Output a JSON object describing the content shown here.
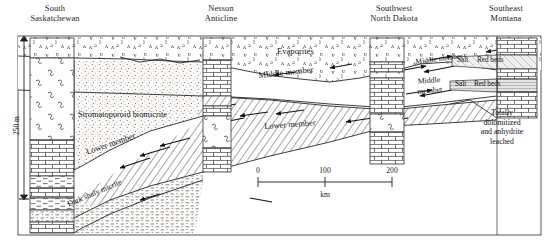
{
  "figure": {
    "type": "geologic-cross-section",
    "orientation": "west-to-east",
    "frame": {
      "x": 18,
      "y": 36,
      "width": 523,
      "height": 199
    }
  },
  "locations": [
    {
      "id": "south-saskatchewan",
      "label": "South\nSaskatchewan",
      "x": 38,
      "y": 4
    },
    {
      "id": "nesson-anticline",
      "label": "Nesson\nAnticline",
      "x": 220,
      "y": 4
    },
    {
      "id": "southwest-north-dakota",
      "label": "Southwest\nNorth Dakota",
      "x": 394,
      "y": 4
    },
    {
      "id": "southeast-montana",
      "label": "Southeast\nMontana",
      "x": 512,
      "y": 4
    }
  ],
  "units": [
    {
      "id": "evaporites",
      "label": "Evaporites",
      "x": 310,
      "y": 52,
      "size": 8.6,
      "italic": false
    },
    {
      "id": "middle-member-main",
      "label": "Middle member",
      "x": 300,
      "y": 78,
      "size": 8.6,
      "rotate": -6
    },
    {
      "id": "middle-member-right-upper",
      "label": "Middle member",
      "x": 456,
      "y": 63,
      "size": 7.4,
      "rotate": -7
    },
    {
      "id": "middle-member-right-lower",
      "label": "Middle\nmembet",
      "x": 437,
      "y": 86,
      "size": 7.8,
      "rotate": -6
    },
    {
      "id": "lower-member-center",
      "label": "Lower member",
      "x": 308,
      "y": 128,
      "size": 8.4,
      "rotate": -4
    },
    {
      "id": "lower-member-left",
      "label": "Lower member",
      "x": 122,
      "y": 157,
      "size": 8.4,
      "rotate": -18
    },
    {
      "id": "stromatoporoid-biomicrite",
      "label": "Stromatoporoid biomicrite",
      "x": 128,
      "y": 117,
      "size": 8.4,
      "rotate": 0
    },
    {
      "id": "dark-shaly-micrite",
      "label": "Dark shaly micrite",
      "x": 112,
      "y": 208,
      "size": 7.8,
      "rotate": -22
    },
    {
      "id": "totally-dolomitized",
      "label": "Totally\ndolomitized\nand anhydrite\nleached",
      "x": 502,
      "y": 113,
      "size": 7.8,
      "rotate": 0
    }
  ],
  "facies_tags": [
    {
      "id": "salt-upper",
      "label": "Salt",
      "x": 464,
      "y": 61
    },
    {
      "id": "red-beds-upper",
      "label": "Red beds",
      "x": 486,
      "y": 60
    },
    {
      "id": "salt-lower",
      "label": "Salt",
      "x": 460,
      "y": 85
    },
    {
      "id": "red-beds-lower",
      "label": "Red beds",
      "x": 482,
      "y": 84
    }
  ],
  "vertical_scale": {
    "label": "250 m",
    "x": 12,
    "top": 40,
    "bottom": 196
  },
  "horizontal_scale": {
    "unit": "km",
    "ticks": [
      "0",
      "100",
      "200"
    ],
    "x_start": 258,
    "x_end": 392,
    "y": 182
  },
  "colors": {
    "ink": "#111111",
    "line": "#1a1a1a",
    "frame": "#333333",
    "hatch": "#2b2b2b",
    "stipple": "#3a3a3a",
    "paper": "#ffffff",
    "tint": "#f4f2ee"
  },
  "wells": [
    {
      "id": "well-saskatchewan",
      "x": 30,
      "width": 44,
      "top": 38,
      "bottom": 233
    },
    {
      "id": "well-nesson",
      "x": 203,
      "width": 28,
      "top": 38,
      "bottom": 172
    },
    {
      "id": "well-north-dakota",
      "x": 370,
      "width": 34,
      "top": 38,
      "bottom": 168
    },
    {
      "id": "well-montana",
      "x": 497,
      "width": 40,
      "top": 38,
      "bottom": 158
    }
  ]
}
